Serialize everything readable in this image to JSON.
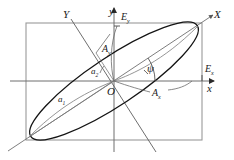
{
  "figure": {
    "colors": {
      "ellipse": "#141414",
      "axis": "#4a4a4a",
      "rectangle": "#8a8a8a",
      "construction": "#6e6e6e",
      "text": "#1a1a1a",
      "background": "#ffffff"
    },
    "labels": [
      {
        "id": "axis-Y",
        "text": "Y",
        "sub": "",
        "x": 63,
        "y": 9,
        "size": "big"
      },
      {
        "id": "axis-y",
        "text": "y",
        "sub": "",
        "x": 109,
        "y": 6,
        "size": "big"
      },
      {
        "id": "field-Ey",
        "text": "E",
        "sub": "y",
        "x": 121,
        "y": 12,
        "size": "mid"
      },
      {
        "id": "axis-X",
        "text": "X",
        "sub": "",
        "x": 214,
        "y": 9,
        "size": "big"
      },
      {
        "id": "amp-Ay",
        "text": "A",
        "sub": "y",
        "x": 102,
        "y": 44,
        "size": "mid"
      },
      {
        "id": "semi-a2",
        "text": "a",
        "sub": "2",
        "x": 91,
        "y": 67,
        "size": "sml"
      },
      {
        "id": "angle-psi",
        "text": "ψ",
        "sub": "",
        "x": 147,
        "y": 63,
        "size": "big"
      },
      {
        "id": "field-Ex",
        "text": "E",
        "sub": "x",
        "x": 205,
        "y": 64,
        "size": "mid"
      },
      {
        "id": "origin-O",
        "text": "O",
        "sub": "",
        "x": 107,
        "y": 86,
        "size": "big"
      },
      {
        "id": "amp-Ax",
        "text": "A",
        "sub": "x",
        "x": 152,
        "y": 88,
        "size": "mid"
      },
      {
        "id": "axis-x",
        "text": "x",
        "sub": "",
        "x": 207,
        "y": 83,
        "size": "big"
      },
      {
        "id": "semi-a1",
        "text": "a",
        "sub": "1",
        "x": 58,
        "y": 95,
        "size": "sml"
      }
    ],
    "geometry": {
      "origin": {
        "x": 114,
        "y": 81
      },
      "rectangle": {
        "left": 26,
        "top": 23,
        "right": 202,
        "bottom": 140
      },
      "ellipse": {
        "cx": 114,
        "cy": 81,
        "semi_major": 100,
        "semi_minor": 24,
        "rotation_deg": -33.6
      },
      "axis_X_deg": -33.6,
      "axis_Y_deg": 56.4,
      "psi_label": "ψ"
    }
  }
}
